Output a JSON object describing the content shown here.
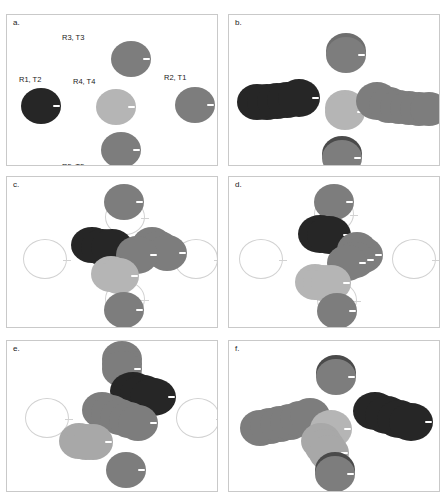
{
  "figure": {
    "title": "",
    "panel_count": 6,
    "colors": {
      "dark": "#262626",
      "mid_dark": "#5e5e5e",
      "mid": "#7d7d7d",
      "light": "#a9a9a9",
      "lighter": "#bdbdbd",
      "ghost_outline": "#d2d2d2",
      "panel_border": "#c9c9c9",
      "background": "#ffffff",
      "text": "#1a1a1a",
      "notch": "#ffffff"
    }
  },
  "panels": [
    {
      "id": "a",
      "label": "a.",
      "annotations": [
        {
          "text": "R3, T3",
          "x": 55,
          "y": 18
        },
        {
          "text": "R1, T2",
          "x": 12,
          "y": 60
        },
        {
          "text": "R4, T4",
          "x": 66,
          "y": 62
        },
        {
          "text": "R2, T1",
          "x": 157,
          "y": 58
        },
        {
          "text": "R5, T5",
          "x": 55,
          "y": 147
        }
      ],
      "ghosts": [],
      "discs": [
        {
          "name": "R3-T3",
          "cx": 124,
          "cy": 44,
          "rx": 20,
          "ry": 18,
          "color": "#7d7d7d"
        },
        {
          "name": "R1-T2",
          "cx": 34,
          "cy": 91,
          "rx": 20,
          "ry": 18,
          "color": "#262626"
        },
        {
          "name": "R4-T4",
          "cx": 109,
          "cy": 92,
          "rx": 20,
          "ry": 18,
          "color": "#b5b5b5"
        },
        {
          "name": "R2-T1",
          "cx": 188,
          "cy": 90,
          "rx": 20,
          "ry": 18,
          "color": "#7d7d7d"
        },
        {
          "name": "R5-T5",
          "cx": 114,
          "cy": 135,
          "rx": 20,
          "ry": 18,
          "color": "#7d7d7d"
        }
      ]
    },
    {
      "id": "b",
      "label": "b.",
      "annotations": [],
      "ghosts": [],
      "discs": [
        {
          "name": "trail-top-1",
          "cx": 117,
          "cy": 36,
          "rx": 20,
          "ry": 18,
          "color": "#6e6e6e"
        },
        {
          "name": "trail-top-2",
          "cx": 117,
          "cy": 40,
          "rx": 20,
          "ry": 18,
          "color": "#7d7d7d"
        },
        {
          "name": "trail-left-1",
          "cx": 28,
          "cy": 87,
          "rx": 20,
          "ry": 18,
          "color": "#262626"
        },
        {
          "name": "trail-left-2",
          "cx": 38,
          "cy": 87,
          "rx": 20,
          "ry": 18,
          "color": "#262626"
        },
        {
          "name": "trail-left-3",
          "cx": 48,
          "cy": 86,
          "rx": 20,
          "ry": 18,
          "color": "#262626"
        },
        {
          "name": "trail-left-4",
          "cx": 58,
          "cy": 85,
          "rx": 20,
          "ry": 18,
          "color": "#262626"
        },
        {
          "name": "trail-left-5",
          "cx": 70,
          "cy": 83,
          "rx": 21,
          "ry": 19,
          "color": "#262626"
        },
        {
          "name": "center-light-1",
          "cx": 116,
          "cy": 93,
          "rx": 20,
          "ry": 18,
          "color": "#b5b5b5"
        },
        {
          "name": "center-light-2",
          "cx": 116,
          "cy": 97,
          "rx": 20,
          "ry": 18,
          "color": "#b5b5b5"
        },
        {
          "name": "trail-right-1",
          "cx": 148,
          "cy": 86,
          "rx": 21,
          "ry": 19,
          "color": "#7d7d7d"
        },
        {
          "name": "trail-right-2",
          "cx": 160,
          "cy": 90,
          "rx": 20,
          "ry": 18,
          "color": "#7d7d7d"
        },
        {
          "name": "trail-right-3",
          "cx": 170,
          "cy": 92,
          "rx": 19,
          "ry": 17,
          "color": "#7d7d7d"
        },
        {
          "name": "trail-right-4",
          "cx": 180,
          "cy": 93,
          "rx": 19,
          "ry": 17,
          "color": "#7d7d7d"
        },
        {
          "name": "trail-right-5",
          "cx": 190,
          "cy": 94,
          "rx": 19,
          "ry": 17,
          "color": "#7d7d7d"
        },
        {
          "name": "trail-right-6",
          "cx": 200,
          "cy": 94,
          "rx": 19,
          "ry": 17,
          "color": "#7d7d7d"
        },
        {
          "name": "trail-bottom-1",
          "cx": 113,
          "cy": 139,
          "rx": 20,
          "ry": 18,
          "color": "#4a4a4a"
        },
        {
          "name": "trail-bottom-2",
          "cx": 113,
          "cy": 143,
          "rx": 20,
          "ry": 18,
          "color": "#7d7d7d"
        }
      ]
    },
    {
      "id": "c",
      "label": "c.",
      "annotations": [],
      "ghosts": [
        {
          "name": "ghost-left",
          "cx": 38,
          "cy": 82,
          "rx": 22,
          "ry": 20
        },
        {
          "name": "ghost-right",
          "cx": 189,
          "cy": 82,
          "rx": 22,
          "ry": 20
        },
        {
          "name": "ghost-top",
          "cx": 118,
          "cy": 40,
          "rx": 20,
          "ry": 18
        },
        {
          "name": "ghost-bottom",
          "cx": 118,
          "cy": 122,
          "rx": 20,
          "ry": 18
        }
      ],
      "discs": [
        {
          "name": "top-disc",
          "cx": 117,
          "cy": 25,
          "rx": 20,
          "ry": 18,
          "color": "#7d7d7d"
        },
        {
          "name": "dark-1",
          "cx": 85,
          "cy": 68,
          "rx": 21,
          "ry": 18,
          "color": "#262626"
        },
        {
          "name": "dark-2",
          "cx": 95,
          "cy": 70,
          "rx": 21,
          "ry": 18,
          "color": "#262626"
        },
        {
          "name": "dark-3",
          "cx": 105,
          "cy": 70,
          "rx": 21,
          "ry": 18,
          "color": "#262626"
        },
        {
          "name": "mid-right-1",
          "cx": 145,
          "cy": 68,
          "rx": 20,
          "ry": 18,
          "color": "#7d7d7d"
        },
        {
          "name": "mid-right-2",
          "cx": 152,
          "cy": 72,
          "rx": 20,
          "ry": 18,
          "color": "#7d7d7d"
        },
        {
          "name": "mid-right-3",
          "cx": 160,
          "cy": 76,
          "rx": 20,
          "ry": 18,
          "color": "#7d7d7d"
        },
        {
          "name": "mid-center-1",
          "cx": 130,
          "cy": 78,
          "rx": 21,
          "ry": 19,
          "color": "#7d7d7d"
        },
        {
          "name": "light-1",
          "cx": 104,
          "cy": 97,
          "rx": 20,
          "ry": 18,
          "color": "#b5b5b5"
        },
        {
          "name": "light-2",
          "cx": 112,
          "cy": 99,
          "rx": 20,
          "ry": 18,
          "color": "#b5b5b5"
        },
        {
          "name": "bottom-disc",
          "cx": 117,
          "cy": 133,
          "rx": 20,
          "ry": 18,
          "color": "#7d7d7d"
        }
      ]
    },
    {
      "id": "d",
      "label": "d.",
      "annotations": [],
      "ghosts": [
        {
          "name": "ghost-left",
          "cx": 32,
          "cy": 82,
          "rx": 22,
          "ry": 20
        },
        {
          "name": "ghost-right",
          "cx": 185,
          "cy": 82,
          "rx": 22,
          "ry": 20
        },
        {
          "name": "ghost-top",
          "cx": 105,
          "cy": 37,
          "rx": 20,
          "ry": 18
        },
        {
          "name": "ghost-bottom",
          "cx": 108,
          "cy": 123,
          "rx": 20,
          "ry": 18
        }
      ],
      "discs": [
        {
          "name": "top-disc",
          "cx": 105,
          "cy": 25,
          "rx": 20,
          "ry": 18,
          "color": "#7d7d7d"
        },
        {
          "name": "dark-1",
          "cx": 91,
          "cy": 57,
          "rx": 22,
          "ry": 19,
          "color": "#262626"
        },
        {
          "name": "dark-2",
          "cx": 100,
          "cy": 58,
          "rx": 22,
          "ry": 19,
          "color": "#262626"
        },
        {
          "name": "mid-1",
          "cx": 128,
          "cy": 73,
          "rx": 20,
          "ry": 18,
          "color": "#7d7d7d"
        },
        {
          "name": "mid-2",
          "cx": 134,
          "cy": 78,
          "rx": 20,
          "ry": 18,
          "color": "#7d7d7d"
        },
        {
          "name": "mid-3",
          "cx": 126,
          "cy": 83,
          "rx": 20,
          "ry": 18,
          "color": "#7d7d7d"
        },
        {
          "name": "mid-4",
          "cx": 118,
          "cy": 86,
          "rx": 20,
          "ry": 18,
          "color": "#7d7d7d"
        },
        {
          "name": "light-1",
          "cx": 86,
          "cy": 105,
          "rx": 20,
          "ry": 18,
          "color": "#b5b5b5"
        },
        {
          "name": "light-2",
          "cx": 94,
          "cy": 106,
          "rx": 20,
          "ry": 18,
          "color": "#b5b5b5"
        },
        {
          "name": "light-3",
          "cx": 102,
          "cy": 106,
          "rx": 20,
          "ry": 18,
          "color": "#b5b5b5"
        },
        {
          "name": "bottom-disc",
          "cx": 108,
          "cy": 134,
          "rx": 20,
          "ry": 18,
          "color": "#7d7d7d"
        }
      ]
    },
    {
      "id": "e",
      "label": "e.",
      "annotations": [],
      "ghosts": [
        {
          "name": "ghost-left",
          "cx": 40,
          "cy": 77,
          "rx": 22,
          "ry": 20
        },
        {
          "name": "ghost-right",
          "cx": 191,
          "cy": 77,
          "rx": 22,
          "ry": 20
        }
      ],
      "discs": [
        {
          "name": "top-1",
          "cx": 115,
          "cy": 18,
          "rx": 20,
          "ry": 18,
          "color": "#7d7d7d"
        },
        {
          "name": "top-2",
          "cx": 115,
          "cy": 23,
          "rx": 20,
          "ry": 18,
          "color": "#7d7d7d"
        },
        {
          "name": "top-3",
          "cx": 115,
          "cy": 28,
          "rx": 20,
          "ry": 18,
          "color": "#7d7d7d"
        },
        {
          "name": "dark-1",
          "cx": 126,
          "cy": 50,
          "rx": 23,
          "ry": 19,
          "color": "#262626"
        },
        {
          "name": "dark-2",
          "cx": 136,
          "cy": 53,
          "rx": 23,
          "ry": 19,
          "color": "#262626"
        },
        {
          "name": "dark-3",
          "cx": 146,
          "cy": 56,
          "rx": 23,
          "ry": 19,
          "color": "#262626"
        },
        {
          "name": "mid-1",
          "cx": 95,
          "cy": 69,
          "rx": 20,
          "ry": 18,
          "color": "#7d7d7d"
        },
        {
          "name": "mid-2",
          "cx": 104,
          "cy": 72,
          "rx": 20,
          "ry": 18,
          "color": "#7d7d7d"
        },
        {
          "name": "mid-3",
          "cx": 113,
          "cy": 76,
          "rx": 20,
          "ry": 18,
          "color": "#7d7d7d"
        },
        {
          "name": "mid-4",
          "cx": 122,
          "cy": 79,
          "rx": 20,
          "ry": 18,
          "color": "#7d7d7d"
        },
        {
          "name": "mid-5",
          "cx": 131,
          "cy": 82,
          "rx": 20,
          "ry": 18,
          "color": "#7d7d7d"
        },
        {
          "name": "light-1",
          "cx": 72,
          "cy": 100,
          "rx": 20,
          "ry": 18,
          "color": "#a8a8a8"
        },
        {
          "name": "light-2",
          "cx": 79,
          "cy": 101,
          "rx": 20,
          "ry": 18,
          "color": "#a8a8a8"
        },
        {
          "name": "light-3",
          "cx": 86,
          "cy": 101,
          "rx": 20,
          "ry": 18,
          "color": "#a8a8a8"
        },
        {
          "name": "bottom-disc",
          "cx": 119,
          "cy": 129,
          "rx": 20,
          "ry": 18,
          "color": "#7d7d7d"
        }
      ]
    },
    {
      "id": "f",
      "label": "f.",
      "annotations": [],
      "ghosts": [],
      "discs": [
        {
          "name": "top-disc-shadow",
          "cx": 107,
          "cy": 32,
          "rx": 20,
          "ry": 18,
          "color": "#4a4a4a"
        },
        {
          "name": "top-disc",
          "cx": 107,
          "cy": 36,
          "rx": 20,
          "ry": 18,
          "color": "#7d7d7d"
        },
        {
          "name": "mid-trail-1",
          "cx": 31,
          "cy": 87,
          "rx": 20,
          "ry": 18,
          "color": "#7d7d7d"
        },
        {
          "name": "mid-trail-2",
          "cx": 41,
          "cy": 85,
          "rx": 20,
          "ry": 18,
          "color": "#7d7d7d"
        },
        {
          "name": "mid-trail-3",
          "cx": 51,
          "cy": 83,
          "rx": 20,
          "ry": 18,
          "color": "#7d7d7d"
        },
        {
          "name": "mid-trail-4",
          "cx": 61,
          "cy": 81,
          "rx": 20,
          "ry": 18,
          "color": "#7d7d7d"
        },
        {
          "name": "mid-trail-5",
          "cx": 71,
          "cy": 78,
          "rx": 20,
          "ry": 18,
          "color": "#7d7d7d"
        },
        {
          "name": "mid-trail-6",
          "cx": 81,
          "cy": 75,
          "rx": 20,
          "ry": 18,
          "color": "#7d7d7d"
        },
        {
          "name": "light-center-1",
          "cx": 102,
          "cy": 88,
          "rx": 21,
          "ry": 19,
          "color": "#b5b5b5"
        },
        {
          "name": "light-down-1",
          "cx": 92,
          "cy": 100,
          "rx": 20,
          "ry": 18,
          "color": "#a8a8a8"
        },
        {
          "name": "light-down-2",
          "cx": 96,
          "cy": 106,
          "rx": 20,
          "ry": 18,
          "color": "#a8a8a8"
        },
        {
          "name": "light-down-3",
          "cx": 100,
          "cy": 112,
          "rx": 20,
          "ry": 18,
          "color": "#a8a8a8"
        },
        {
          "name": "dark-1",
          "cx": 146,
          "cy": 70,
          "rx": 22,
          "ry": 19,
          "color": "#262626"
        },
        {
          "name": "dark-2",
          "cx": 158,
          "cy": 74,
          "rx": 22,
          "ry": 19,
          "color": "#262626"
        },
        {
          "name": "dark-3",
          "cx": 170,
          "cy": 78,
          "rx": 22,
          "ry": 19,
          "color": "#262626"
        },
        {
          "name": "dark-4",
          "cx": 182,
          "cy": 81,
          "rx": 22,
          "ry": 19,
          "color": "#262626"
        },
        {
          "name": "bottom-disc-shadow",
          "cx": 106,
          "cy": 129,
          "rx": 20,
          "ry": 18,
          "color": "#4a4a4a"
        },
        {
          "name": "bottom-disc",
          "cx": 106,
          "cy": 133,
          "rx": 20,
          "ry": 18,
          "color": "#7d7d7d"
        }
      ]
    }
  ]
}
